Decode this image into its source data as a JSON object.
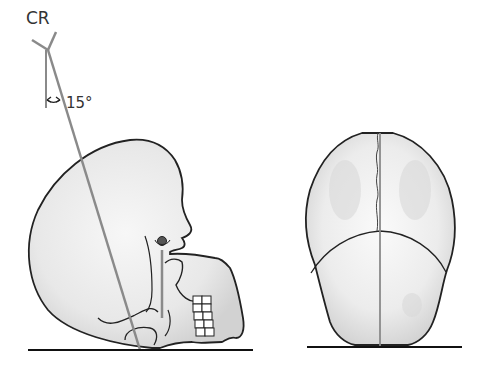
{
  "diagram": {
    "labels": {
      "central_ray": "CR",
      "angle": "15°"
    },
    "views": [
      {
        "name": "lateral-view",
        "description": "Lateral skull with central ray angled 15° from vertical"
      },
      {
        "name": "frontal-view",
        "description": "Posteroanterior/axial view of skull with midline"
      }
    ],
    "colors": {
      "outline": "#222222",
      "ray": "#8a8a8a",
      "skull_fill": "#ececec",
      "skull_shade": "#d4d4d4",
      "baseline": "#111111",
      "label": "#333333"
    }
  }
}
